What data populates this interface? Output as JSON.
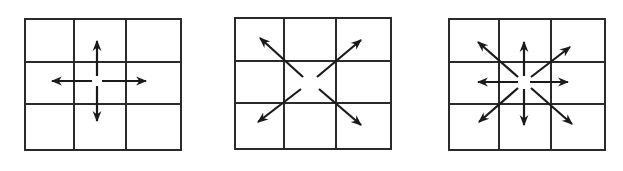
{
  "diagram": {
    "panels": [
      {
        "id": "four-neighborhood",
        "grid": {
          "x": 25,
          "y": 19,
          "w": 156,
          "h": 131,
          "rows": 3,
          "cols": 3
        },
        "center": [
          100,
          83
        ],
        "arrows": [
          "up",
          "down",
          "left",
          "right"
        ]
      },
      {
        "id": "diagonal-neighborhood",
        "grid": {
          "x": 235,
          "y": 18,
          "w": 156,
          "h": 131,
          "rows": 3,
          "cols": 3
        },
        "center": [
          310,
          82
        ],
        "arrows": [
          "up-left",
          "up-right",
          "down-left",
          "down-right"
        ]
      },
      {
        "id": "eight-neighborhood",
        "grid": {
          "x": 449,
          "y": 19,
          "w": 156,
          "h": 131,
          "rows": 3,
          "cols": 3
        },
        "center": [
          525,
          83
        ],
        "arrows": [
          "up",
          "down",
          "left",
          "right",
          "up-left",
          "up-right",
          "down-left",
          "down-right"
        ]
      }
    ],
    "colors": {
      "line": "#2a2a2a",
      "arrow": "#1a1a1a",
      "background": "#ffffff"
    }
  }
}
